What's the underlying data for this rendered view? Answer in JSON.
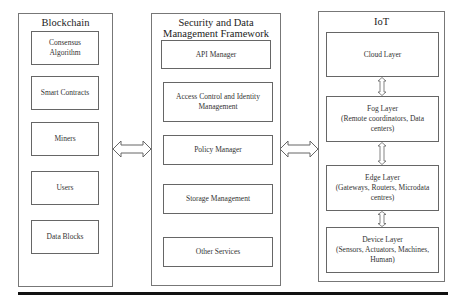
{
  "blockchain": {
    "title": "Blockchain",
    "items": [
      {
        "label": "Consensus Algorithm"
      },
      {
        "label": "Smart Contracts"
      },
      {
        "label": "Miners"
      },
      {
        "label": "Users"
      },
      {
        "label": "Data Blocks"
      }
    ]
  },
  "framework": {
    "title": "Security and Data Management Framework",
    "items": [
      {
        "label": "API Manager"
      },
      {
        "label": "Access Control and Identity Management"
      },
      {
        "label": "Policy Manager"
      },
      {
        "label": "Storage Management"
      },
      {
        "label": "Other Services"
      }
    ]
  },
  "iot": {
    "title": "IoT",
    "layers": [
      {
        "name": "Cloud Layer",
        "detail": ""
      },
      {
        "name": "Fog Layer",
        "detail": "(Remote coordinators, Data centers)"
      },
      {
        "name": "Edge Layer",
        "detail": "(Gateways, Routers, Microdata centres)"
      },
      {
        "name": "Device Layer",
        "detail": "(Sensors, Actuators, Machines, Human)"
      }
    ]
  },
  "connectors": {
    "blockchain_framework": "bidirectional-arrow",
    "framework_iot": "bidirectional-arrow",
    "iot_layers": "bidirectional-arrow"
  }
}
